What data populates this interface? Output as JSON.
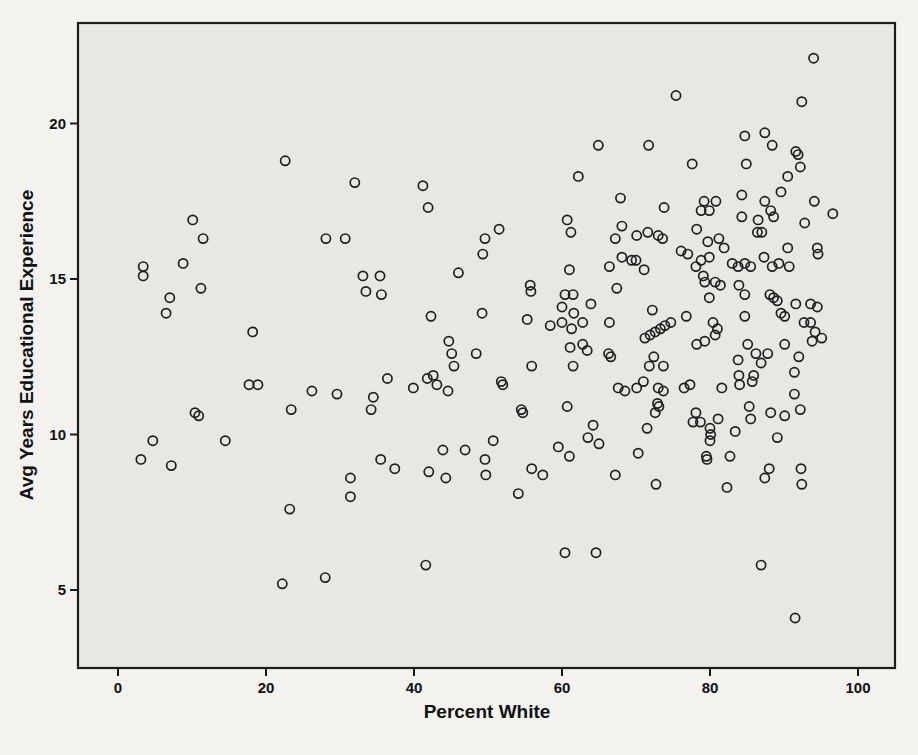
{
  "page": {
    "background": "#f3f2ee"
  },
  "chart_data": {
    "type": "scatter",
    "title": "",
    "xlabel": "Percent White",
    "ylabel": "Avg Years Educational Experience",
    "x_ticks": [
      0,
      20,
      40,
      60,
      80,
      100
    ],
    "y_ticks": [
      5,
      10,
      15,
      20
    ],
    "xlim": [
      -5.4,
      105.0
    ],
    "ylim": [
      2.5,
      23.2
    ],
    "grid": false,
    "legend": "none",
    "marker": {
      "shape": "open-circle",
      "radius": 4.6,
      "stroke": "#1f1f1f",
      "stroke_width": 1.7,
      "fill": "none"
    },
    "panel": {
      "fill": "#e8e7e3",
      "border": "#1c1c1c",
      "border_width": 2.2
    },
    "tick_label_color": "#111111",
    "points": [
      [
        22.6,
        18.8
      ],
      [
        10.1,
        16.9
      ],
      [
        11.5,
        16.3
      ],
      [
        28.1,
        16.3
      ],
      [
        30.7,
        16.3
      ],
      [
        8.8,
        15.5
      ],
      [
        3.4,
        15.4
      ],
      [
        3.4,
        15.1
      ],
      [
        11.2,
        14.7
      ],
      [
        7.0,
        14.4
      ],
      [
        6.5,
        13.9
      ],
      [
        18.2,
        13.3
      ],
      [
        64.9,
        19.3
      ],
      [
        32.0,
        18.1
      ],
      [
        41.2,
        18.0
      ],
      [
        41.9,
        17.3
      ],
      [
        62.2,
        18.3
      ],
      [
        60.7,
        16.9
      ],
      [
        61.2,
        16.5
      ],
      [
        51.5,
        16.6
      ],
      [
        49.6,
        16.3
      ],
      [
        67.2,
        16.3
      ],
      [
        49.3,
        15.8
      ],
      [
        46.0,
        15.2
      ],
      [
        33.1,
        15.1
      ],
      [
        35.4,
        15.1
      ],
      [
        33.5,
        14.6
      ],
      [
        35.6,
        14.5
      ],
      [
        61.0,
        15.3
      ],
      [
        66.4,
        15.4
      ],
      [
        55.7,
        14.8
      ],
      [
        55.8,
        14.6
      ],
      [
        67.4,
        14.7
      ],
      [
        60.4,
        14.5
      ],
      [
        61.5,
        14.5
      ],
      [
        63.9,
        14.2
      ],
      [
        60.0,
        14.1
      ],
      [
        61.6,
        13.9
      ],
      [
        60.0,
        13.6
      ],
      [
        62.8,
        13.6
      ],
      [
        61.3,
        13.4
      ],
      [
        58.4,
        13.5
      ],
      [
        66.4,
        13.6
      ],
      [
        42.3,
        13.8
      ],
      [
        49.2,
        13.9
      ],
      [
        55.3,
        13.7
      ],
      [
        94.0,
        22.1
      ],
      [
        75.4,
        20.9
      ],
      [
        92.4,
        20.7
      ],
      [
        71.7,
        19.3
      ],
      [
        84.7,
        19.6
      ],
      [
        87.4,
        19.7
      ],
      [
        88.4,
        19.3
      ],
      [
        91.6,
        19.1
      ],
      [
        91.9,
        19.0
      ],
      [
        77.6,
        18.7
      ],
      [
        84.9,
        18.7
      ],
      [
        92.2,
        18.6
      ],
      [
        90.5,
        18.3
      ],
      [
        89.6,
        17.8
      ],
      [
        67.9,
        17.6
      ],
      [
        68.1,
        16.7
      ],
      [
        84.3,
        17.7
      ],
      [
        79.2,
        17.5
      ],
      [
        80.8,
        17.5
      ],
      [
        78.8,
        17.2
      ],
      [
        79.9,
        17.2
      ],
      [
        87.4,
        17.5
      ],
      [
        88.2,
        17.2
      ],
      [
        88.6,
        17.0
      ],
      [
        84.3,
        17.0
      ],
      [
        86.5,
        16.9
      ],
      [
        94.1,
        17.5
      ],
      [
        92.8,
        16.8
      ],
      [
        96.6,
        17.1
      ],
      [
        73.8,
        17.3
      ],
      [
        86.4,
        16.5
      ],
      [
        87.0,
        16.5
      ],
      [
        70.1,
        16.4
      ],
      [
        71.6,
        16.5
      ],
      [
        73.0,
        16.4
      ],
      [
        73.6,
        16.3
      ],
      [
        78.2,
        16.6
      ],
      [
        79.7,
        16.2
      ],
      [
        81.2,
        16.3
      ],
      [
        81.9,
        16.0
      ],
      [
        90.5,
        16.0
      ],
      [
        94.5,
        16.0
      ],
      [
        94.6,
        15.8
      ],
      [
        76.1,
        15.9
      ],
      [
        77.0,
        15.8
      ],
      [
        69.4,
        15.6
      ],
      [
        70.0,
        15.6
      ],
      [
        71.1,
        15.3
      ],
      [
        78.8,
        15.6
      ],
      [
        78.1,
        15.4
      ],
      [
        79.9,
        15.7
      ],
      [
        68.1,
        15.7
      ],
      [
        83.0,
        15.5
      ],
      [
        83.8,
        15.4
      ],
      [
        84.7,
        15.5
      ],
      [
        85.5,
        15.4
      ],
      [
        87.3,
        15.7
      ],
      [
        88.4,
        15.4
      ],
      [
        89.3,
        15.5
      ],
      [
        90.7,
        15.4
      ],
      [
        79.1,
        15.1
      ],
      [
        79.3,
        14.9
      ],
      [
        80.7,
        14.9
      ],
      [
        81.4,
        14.8
      ],
      [
        79.9,
        14.4
      ],
      [
        83.9,
        14.8
      ],
      [
        84.7,
        14.5
      ],
      [
        88.1,
        14.5
      ],
      [
        88.6,
        14.4
      ],
      [
        89.1,
        14.3
      ],
      [
        91.6,
        14.2
      ],
      [
        93.6,
        14.2
      ],
      [
        94.5,
        14.1
      ],
      [
        89.6,
        13.9
      ],
      [
        90.1,
        13.8
      ],
      [
        92.7,
        13.6
      ],
      [
        93.6,
        13.6
      ],
      [
        72.2,
        14.0
      ],
      [
        76.8,
        13.8
      ],
      [
        71.2,
        13.1
      ],
      [
        71.9,
        13.2
      ],
      [
        72.6,
        13.3
      ],
      [
        73.3,
        13.4
      ],
      [
        73.9,
        13.5
      ],
      [
        74.7,
        13.6
      ],
      [
        80.4,
        13.6
      ],
      [
        81.0,
        13.4
      ],
      [
        80.7,
        13.2
      ],
      [
        84.7,
        13.8
      ],
      [
        94.2,
        13.3
      ],
      [
        95.1,
        13.1
      ],
      [
        17.7,
        11.6
      ],
      [
        18.9,
        11.6
      ],
      [
        26.2,
        11.4
      ],
      [
        29.6,
        11.3
      ],
      [
        23.4,
        10.8
      ],
      [
        10.4,
        10.7
      ],
      [
        10.9,
        10.6
      ],
      [
        4.7,
        9.8
      ],
      [
        14.5,
        9.8
      ],
      [
        3.1,
        9.2
      ],
      [
        7.2,
        9.0
      ],
      [
        23.2,
        7.6
      ],
      [
        22.2,
        5.2
      ],
      [
        28.0,
        5.4
      ],
      [
        44.7,
        13.0
      ],
      [
        45.1,
        12.6
      ],
      [
        45.4,
        12.2
      ],
      [
        48.4,
        12.6
      ],
      [
        61.1,
        12.8
      ],
      [
        62.8,
        12.9
      ],
      [
        63.4,
        12.7
      ],
      [
        66.3,
        12.6
      ],
      [
        66.6,
        12.5
      ],
      [
        55.9,
        12.2
      ],
      [
        61.5,
        12.2
      ],
      [
        36.4,
        11.8
      ],
      [
        41.8,
        11.8
      ],
      [
        42.6,
        11.9
      ],
      [
        43.1,
        11.6
      ],
      [
        44.6,
        11.4
      ],
      [
        39.9,
        11.5
      ],
      [
        34.5,
        11.2
      ],
      [
        34.2,
        10.8
      ],
      [
        51.8,
        11.7
      ],
      [
        52.0,
        11.6
      ],
      [
        54.5,
        10.8
      ],
      [
        54.7,
        10.7
      ],
      [
        60.7,
        10.9
      ],
      [
        64.2,
        10.3
      ],
      [
        63.5,
        9.9
      ],
      [
        65.0,
        9.7
      ],
      [
        50.7,
        9.8
      ],
      [
        43.9,
        9.5
      ],
      [
        46.9,
        9.5
      ],
      [
        35.5,
        9.2
      ],
      [
        37.4,
        8.9
      ],
      [
        42.0,
        8.8
      ],
      [
        44.3,
        8.6
      ],
      [
        49.6,
        9.2
      ],
      [
        49.7,
        8.7
      ],
      [
        55.9,
        8.9
      ],
      [
        57.4,
        8.7
      ],
      [
        59.5,
        9.6
      ],
      [
        61.0,
        9.3
      ],
      [
        67.2,
        8.7
      ],
      [
        31.4,
        8.6
      ],
      [
        31.4,
        8.0
      ],
      [
        54.1,
        8.1
      ],
      [
        60.4,
        6.2
      ],
      [
        64.6,
        6.2
      ],
      [
        41.6,
        5.8
      ],
      [
        78.2,
        12.9
      ],
      [
        79.3,
        13.0
      ],
      [
        85.1,
        12.9
      ],
      [
        90.1,
        12.9
      ],
      [
        93.8,
        13.0
      ],
      [
        72.4,
        12.5
      ],
      [
        71.8,
        12.2
      ],
      [
        73.7,
        12.2
      ],
      [
        83.8,
        12.4
      ],
      [
        86.2,
        12.6
      ],
      [
        86.9,
        12.3
      ],
      [
        87.8,
        12.6
      ],
      [
        92.0,
        12.5
      ],
      [
        91.4,
        12.0
      ],
      [
        83.9,
        11.9
      ],
      [
        85.9,
        11.9
      ],
      [
        84.0,
        11.6
      ],
      [
        85.7,
        11.7
      ],
      [
        70.1,
        11.5
      ],
      [
        71.0,
        11.7
      ],
      [
        73.0,
        11.5
      ],
      [
        73.7,
        11.4
      ],
      [
        72.9,
        11.0
      ],
      [
        73.1,
        10.9
      ],
      [
        72.6,
        10.7
      ],
      [
        76.5,
        11.5
      ],
      [
        77.3,
        11.6
      ],
      [
        81.6,
        11.5
      ],
      [
        78.1,
        10.7
      ],
      [
        77.7,
        10.4
      ],
      [
        78.7,
        10.4
      ],
      [
        80.0,
        10.2
      ],
      [
        81.1,
        10.5
      ],
      [
        80.1,
        10.0
      ],
      [
        80.0,
        9.8
      ],
      [
        83.4,
        10.1
      ],
      [
        85.3,
        10.9
      ],
      [
        85.5,
        10.5
      ],
      [
        88.2,
        10.7
      ],
      [
        90.1,
        10.6
      ],
      [
        91.4,
        11.3
      ],
      [
        92.2,
        10.8
      ],
      [
        89.1,
        9.9
      ],
      [
        71.5,
        10.2
      ],
      [
        70.3,
        9.4
      ],
      [
        79.5,
        9.3
      ],
      [
        79.6,
        9.2
      ],
      [
        82.7,
        9.3
      ],
      [
        87.4,
        8.6
      ],
      [
        88.0,
        8.9
      ],
      [
        92.3,
        8.9
      ],
      [
        92.4,
        8.4
      ],
      [
        72.7,
        8.4
      ],
      [
        82.3,
        8.3
      ],
      [
        86.9,
        5.8
      ],
      [
        91.5,
        4.1
      ],
      [
        67.6,
        11.5
      ],
      [
        68.5,
        11.4
      ]
    ],
    "pixel_geometry": {
      "panel": {
        "x": 78,
        "y": 23,
        "width": 817,
        "height": 645
      },
      "x_scale": {
        "origin_px": 118,
        "px_per_unit": 7.4
      },
      "y_scale": {
        "origin_value": 5,
        "origin_px": 590,
        "px_per_unit": 31.1
      },
      "tick_length": 8
    }
  }
}
